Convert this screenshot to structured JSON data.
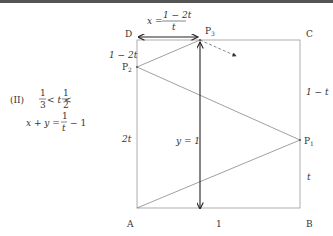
{
  "diagram": {
    "vertices": {
      "A": "A",
      "B": "B",
      "C": "C",
      "D": "D"
    },
    "points": {
      "P1": "P",
      "P1_sub": "1",
      "P2": "P",
      "P2_sub": "2",
      "P3": "P",
      "P3_sub": "3"
    },
    "side_labels": {
      "DP2": "1 − 2t",
      "P2A": "2t",
      "CP1": "1 − t",
      "P1B": "t",
      "AB": "1"
    },
    "x_label": {
      "lhs": "x =",
      "num": "1 − 2t",
      "den": "t"
    },
    "y_label": "y = 1"
  },
  "condition": {
    "case": "(II)",
    "ineq": {
      "left_num": "1",
      "left_den": "3",
      "mid": "< t <",
      "right_num": "1",
      "right_den": "2"
    },
    "equation": {
      "lhs": "x + y =",
      "num": "1",
      "den": "t",
      "rhs": "− 1"
    }
  }
}
